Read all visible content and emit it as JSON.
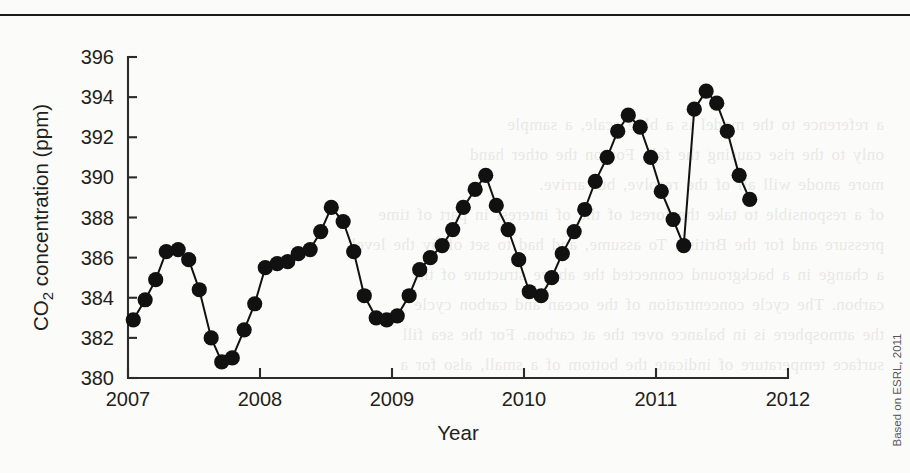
{
  "figure": {
    "credit": "Based on ESRL, 2011",
    "top_rule": true
  },
  "chart_data": {
    "type": "line",
    "title": "",
    "subtitle": "",
    "xlabel": "Year",
    "ylabel": "CO2 concentration (ppm)",
    "ylabel_parts": {
      "pre": "CO",
      "sub": "2",
      "post": " concentration (ppm)"
    },
    "xlim": [
      2007.0,
      2012.0
    ],
    "ylim": [
      380,
      396
    ],
    "ytick_labels": [
      "380",
      "382",
      "384",
      "386",
      "388",
      "390",
      "392",
      "394",
      "396"
    ],
    "yticks": [
      380,
      382,
      384,
      386,
      388,
      390,
      392,
      394,
      396
    ],
    "xtick_labels": [
      "2007",
      "2008",
      "2009",
      "2010",
      "2011",
      "2012"
    ],
    "xticks": [
      2007,
      2008,
      2009,
      2010,
      2011,
      2012
    ],
    "grid": false,
    "legend": false,
    "marker": "filled-circle",
    "marker_color": "#111111",
    "line_color": "#111111",
    "series": [
      {
        "name": "Monthly mean CO2 concentration",
        "x": [
          2007.04,
          2007.13,
          2007.21,
          2007.29,
          2007.38,
          2007.46,
          2007.54,
          2007.63,
          2007.71,
          2007.79,
          2007.88,
          2007.96,
          2008.04,
          2008.13,
          2008.21,
          2008.29,
          2008.38,
          2008.46,
          2008.54,
          2008.63,
          2008.71,
          2008.79,
          2008.88,
          2008.96,
          2009.04,
          2009.13,
          2009.21,
          2009.29,
          2009.38,
          2009.46,
          2009.54,
          2009.63,
          2009.71,
          2009.79,
          2009.88,
          2009.96,
          2010.04,
          2010.13,
          2010.21,
          2010.29,
          2010.38,
          2010.46,
          2010.54,
          2010.63,
          2010.71,
          2010.79,
          2010.88,
          2010.96,
          2011.04,
          2011.13,
          2011.21,
          2011.29,
          2011.38,
          2011.46,
          2011.54,
          2011.63,
          2011.71
        ],
        "y": [
          382.9,
          383.9,
          384.9,
          386.3,
          386.4,
          385.9,
          384.4,
          382.0,
          380.8,
          381.0,
          382.4,
          383.7,
          385.5,
          385.7,
          385.8,
          386.2,
          386.4,
          387.3,
          388.5,
          387.8,
          386.3,
          384.1,
          383.0,
          382.9,
          383.1,
          384.1,
          385.4,
          386.0,
          386.6,
          387.4,
          388.5,
          389.4,
          390.1,
          388.6,
          387.4,
          385.9,
          384.3,
          384.1,
          385.0,
          386.2,
          387.3,
          388.4,
          389.8,
          391.0,
          392.3,
          393.1,
          392.5,
          391.0,
          389.3,
          387.9,
          386.6,
          387.1,
          388.3,
          389.4,
          390.6,
          391.5,
          392.4
        ]
      }
    ],
    "extra_points": {
      "description": "Tail of 2011 season after peak",
      "x": [
        2011.29,
        2011.38,
        2011.46,
        2011.54,
        2011.63,
        2011.71
      ],
      "y": [
        393.4,
        394.3,
        393.7,
        392.3,
        390.1,
        388.9
      ]
    }
  }
}
